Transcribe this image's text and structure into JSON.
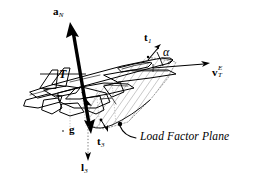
{
  "figure": {
    "background_color": "#ffffff",
    "ink_color": "#000000",
    "hatch_color": "#a8a8a8",
    "dotted_color": "#7a7a7a"
  },
  "labels": {
    "normal_acceleration": {
      "symbol": "a",
      "subscript": "N",
      "text": "a"
    },
    "thrust": {
      "text": "T"
    },
    "thrust_axis_1": {
      "symbol": "t",
      "subscript": "1",
      "text": "t"
    },
    "thrust_axis_3": {
      "symbol": "t",
      "subscript": "3",
      "text": "t"
    },
    "gravity": {
      "text": "g"
    },
    "lift_axis_3": {
      "symbol": "l",
      "subscript": "3",
      "text": "l"
    },
    "velocity": {
      "symbol": "v",
      "subscript": "T",
      "superscript": "E",
      "text": "v"
    },
    "angle_of_attack": {
      "text": "α"
    },
    "plane_caption": {
      "text": "Load Factor Plane"
    }
  },
  "vectors": [
    {
      "name": "a_N",
      "label": "a",
      "subscript": "N",
      "direction": "up-left",
      "style": "thick-solid-arrow"
    },
    {
      "name": "g",
      "label": "g",
      "direction": "down",
      "style": "thick-solid-arrow"
    },
    {
      "name": "t_1",
      "label": "t",
      "subscript": "1",
      "direction": "up-right",
      "style": "thin-solid-arrow"
    },
    {
      "name": "t_3",
      "label": "t",
      "subscript": "3",
      "direction": "down-right",
      "style": "thin-solid-arrow"
    },
    {
      "name": "l_3",
      "label": "l",
      "subscript": "3",
      "direction": "down",
      "style": "thin-dotted-arrow"
    },
    {
      "name": "v_T_E",
      "label": "v",
      "subscript": "T",
      "superscript": "E",
      "direction": "right",
      "style": "thin-solid-arrow"
    }
  ],
  "annotations": {
    "angle_marker": {
      "text": "α",
      "between": [
        "t_1",
        "v_T_E"
      ]
    },
    "leader": {
      "target": "load-factor-plane",
      "text": "Load Factor Plane"
    }
  }
}
